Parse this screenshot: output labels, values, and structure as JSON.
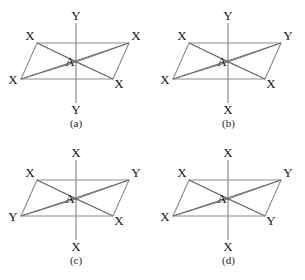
{
  "figure": {
    "partial_top_text": "",
    "center_atom": "A",
    "panels": [
      {
        "id": "a",
        "caption": "(a)",
        "center": "A",
        "ligands": {
          "top_axial": "Y",
          "bottom_axial": "Y",
          "top_left": "X",
          "top_right": "X",
          "bottom_left": "X",
          "bottom_right": "X"
        }
      },
      {
        "id": "b",
        "caption": "(b)",
        "center": "A",
        "ligands": {
          "top_axial": "Y",
          "bottom_axial": "X",
          "top_left": "X",
          "top_right": "Y",
          "bottom_left": "X",
          "bottom_right": "X"
        }
      },
      {
        "id": "c",
        "caption": "(c)",
        "center": "A",
        "ligands": {
          "top_axial": "X",
          "bottom_axial": "X",
          "top_left": "X",
          "top_right": "Y",
          "bottom_left": "Y",
          "bottom_right": "X"
        }
      },
      {
        "id": "d",
        "caption": "(d)",
        "center": "A",
        "ligands": {
          "top_axial": "X",
          "bottom_axial": "X",
          "top_left": "X",
          "top_right": "Y",
          "bottom_left": "X",
          "bottom_right": "Y"
        }
      }
    ],
    "colors": {
      "background": "#ffffff",
      "edge_line": "#8a8a8a",
      "diagonal_line": "#6f6f6f",
      "axis_line": "#7d7d7d",
      "text": "#141414"
    }
  }
}
